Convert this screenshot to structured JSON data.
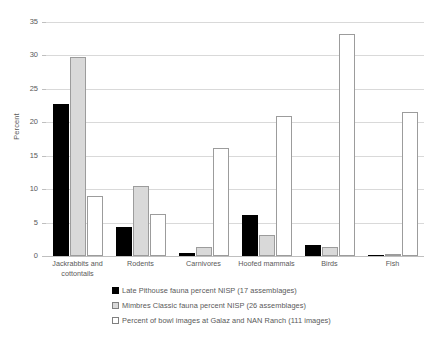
{
  "chart_data": {
    "type": "bar",
    "title": "",
    "xlabel": "",
    "ylabel": "Percent",
    "ylim": [
      0,
      35
    ],
    "yticks": [
      0,
      5,
      10,
      15,
      20,
      25,
      30,
      35
    ],
    "grid": true,
    "legend_position": "bottom",
    "categories": [
      "Jackrabbits and cottontails",
      "Rodents",
      "Carnivores",
      "Hoofed mammals",
      "Birds",
      "Fish"
    ],
    "series": [
      {
        "name": "Late Pithouse fauna percent NISP (17 assemblages)",
        "color": "#000000",
        "values": [
          22.7,
          4.4,
          0.5,
          6.2,
          1.6,
          0.1
        ]
      },
      {
        "name": "Mimbres Classic fauna percent NISP (26 assemblages)",
        "color": "#d9d9d9",
        "values": [
          29.8,
          10.5,
          1.3,
          3.1,
          1.3,
          0.2
        ]
      },
      {
        "name": "Percent of bowl images at Galaz and NAN Ranch (111 images)",
        "color": "#ffffff",
        "values": [
          9.0,
          6.3,
          16.2,
          21.0,
          33.2,
          21.6
        ]
      }
    ]
  },
  "axis": {
    "y_title": "Percent"
  },
  "legend": {
    "items": [
      {
        "marker": "filled-black-square",
        "label": "Late Pithouse fauna percent NISP (17 assemblages)"
      },
      {
        "marker": "gray-square",
        "label": "Mimbres Classic fauna percent NISP (26 assemblages)"
      },
      {
        "marker": "white-square",
        "label": "Percent of bowl images at Galaz and NAN Ranch (111 images)"
      }
    ]
  }
}
